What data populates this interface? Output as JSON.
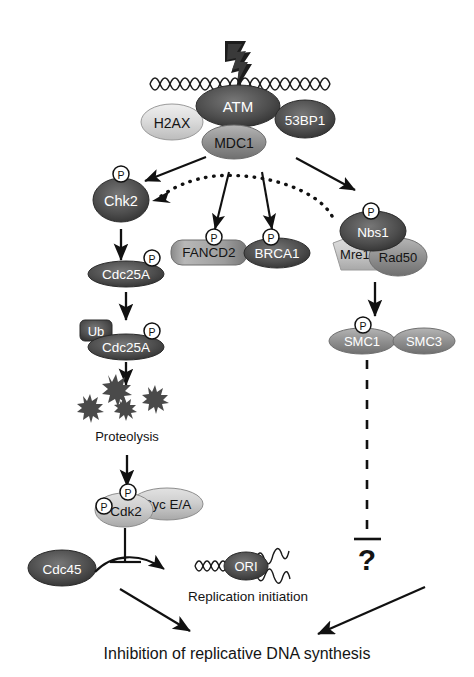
{
  "figure": {
    "bottom_caption": "Inhibition of replicative DNA synthesis",
    "proteolysis_label": "Proteolysis",
    "replication_label": "Replication initiation",
    "unknown_marker": "?"
  },
  "colors": {
    "background": "#ffffff",
    "stroke": "#111111",
    "text_dark": "#141414",
    "text_light": "#ffffff",
    "node_dark": "#4a4a4a",
    "node_dark_edge": "#2b2b2b",
    "node_mid": "#8d8d8d",
    "node_light": "#c9c9c9",
    "node_very_light": "#dcdcdc",
    "phospho_fill": "#ffffff",
    "phospho_stroke": "#111111"
  },
  "nodes": {
    "damage_source": {
      "name": "lightning-bolt",
      "label": ""
    },
    "dna_break": {
      "name": "damaged-dna-helix",
      "label": ""
    },
    "atm": {
      "label": "ATM",
      "shade": "dark",
      "text": "light",
      "shape": "ellipse"
    },
    "h2ax": {
      "label": "H2AX",
      "shade": "very_light",
      "text": "dark",
      "shape": "ellipse"
    },
    "mdc1": {
      "label": "MDC1",
      "shade": "mid",
      "text": "dark",
      "shape": "ellipse"
    },
    "bp53": {
      "label": "53BP1",
      "shade": "dark",
      "text": "light",
      "shape": "ellipse"
    },
    "chk2": {
      "label": "Chk2",
      "shade": "dark",
      "text": "light",
      "shape": "ellipse",
      "phospho": true
    },
    "cdc25a_1": {
      "label": "Cdc25A",
      "shade": "dark",
      "text": "light",
      "shape": "ellipse",
      "phospho": true
    },
    "cdc25a_2": {
      "label": "Cdc25A",
      "shade": "dark",
      "text": "light",
      "shape": "ellipse",
      "phospho": true
    },
    "ub": {
      "label": "Ub",
      "shade": "dark",
      "text": "light",
      "shape": "rounded-rect"
    },
    "fancd2": {
      "label": "FANCD2",
      "shade": "mid",
      "text": "dark",
      "shape": "rounded-rect",
      "phospho": true
    },
    "brca1": {
      "label": "BRCA1",
      "shade": "dark",
      "text": "light",
      "shape": "ellipse",
      "phospho": true
    },
    "nbs1": {
      "label": "Nbs1",
      "shade": "dark",
      "text": "light",
      "shape": "ellipse",
      "phospho": true
    },
    "mre11": {
      "label": "Mre11",
      "shade": "light",
      "text": "dark",
      "shape": "pentagon"
    },
    "rad50": {
      "label": "Rad50",
      "shade": "mid",
      "text": "dark",
      "shape": "ellipse"
    },
    "smc1": {
      "label": "SMC1",
      "shade": "mid",
      "text": "light",
      "shape": "ellipse",
      "phospho": true
    },
    "smc3": {
      "label": "SMC3",
      "shade": "mid",
      "text": "light",
      "shape": "ellipse"
    },
    "cdk2": {
      "label": "Cdk2",
      "shade": "light",
      "text": "dark",
      "shape": "ellipse",
      "phospho": true
    },
    "cyc": {
      "label": "Cyc E/A",
      "shade": "light",
      "text": "dark",
      "shape": "ellipse"
    },
    "cdc45": {
      "label": "Cdc45",
      "shade": "dark",
      "text": "light",
      "shape": "ellipse"
    },
    "ori": {
      "label": "ORI",
      "shade": "dark",
      "text": "light",
      "shape": "ellipse"
    },
    "proteolysis_burst": {
      "name": "proteolysis-starburst",
      "label": ""
    }
  },
  "phospho_glyph": "P",
  "edges": [
    {
      "from": "atm_complex",
      "to": "chk2",
      "type": "arrow"
    },
    {
      "from": "atm_complex",
      "to": "fancd2",
      "type": "arrow"
    },
    {
      "from": "atm_complex",
      "to": "brca1",
      "type": "arrow"
    },
    {
      "from": "atm_complex",
      "to": "nbs1",
      "type": "arrow"
    },
    {
      "from": "mrn_complex",
      "to": "chk2",
      "type": "dotted-arc-arrow"
    },
    {
      "from": "chk2",
      "to": "cdc25a_1",
      "type": "arrow"
    },
    {
      "from": "cdc25a_1",
      "to": "cdc25a_2",
      "type": "arrow"
    },
    {
      "from": "cdc25a_2",
      "to": "proteolysis_burst",
      "type": "arrow"
    },
    {
      "from": "proteolysis_burst",
      "to": "cdk2",
      "type": "arrow"
    },
    {
      "from": "nbs1_complex",
      "to": "smc1",
      "type": "arrow"
    },
    {
      "from": "smc1",
      "to": "unknown",
      "type": "dashed-tbar"
    },
    {
      "from": "cdk2",
      "to": "replication",
      "type": "tbar"
    },
    {
      "from": "cdc45",
      "to": "replication",
      "type": "curved-arrow"
    },
    {
      "from": "cdk2",
      "to": "bottom_caption",
      "type": "arrow"
    },
    {
      "from": "unknown",
      "to": "bottom_caption",
      "type": "arrow"
    }
  ]
}
